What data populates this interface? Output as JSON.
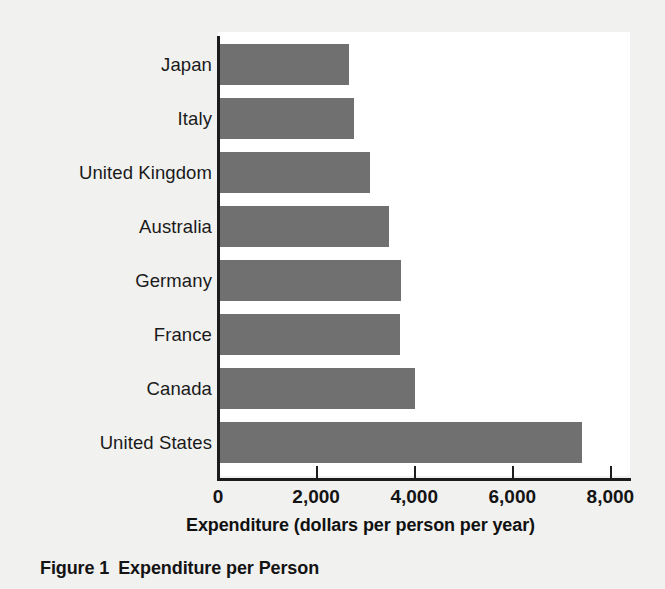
{
  "chart_data": {
    "type": "bar",
    "orientation": "horizontal",
    "title": "",
    "xlabel": "Expenditure (dollars per person per year)",
    "ylabel": "",
    "xlim": [
      0,
      8400
    ],
    "xticks": [
      0,
      2000,
      4000,
      6000,
      8000
    ],
    "xtick_labels": [
      "0",
      "2,000",
      "4,000",
      "6,000",
      "8,000"
    ],
    "grid": false,
    "legend": null,
    "categories": [
      "Japan",
      "Italy",
      "United Kingdom",
      "Australia",
      "Germany",
      "France",
      "Canada",
      "United States"
    ],
    "values": [
      2620,
      2740,
      3050,
      3440,
      3690,
      3670,
      3980,
      7380
    ],
    "bar_color": "#707070",
    "plot_background": "#ffffff",
    "page_background": "#f1f1f0",
    "axis_color": "#1c1c1c"
  },
  "caption": {
    "number": "Figure 1",
    "text": "Expenditure per Person"
  }
}
